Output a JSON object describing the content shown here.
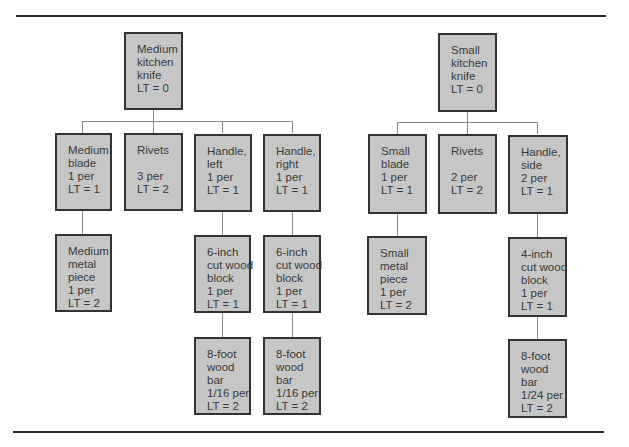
{
  "trees": [
    {
      "root": {
        "lines": [
          "Medium",
          "kitchen",
          "knife",
          "LT = 0"
        ]
      },
      "children": [
        {
          "lines": [
            "Medium",
            "blade",
            "1 per",
            "LT = 1"
          ],
          "children": [
            {
              "lines": [
                "Medium",
                "metal",
                "piece",
                "1 per",
                "LT = 2"
              ]
            }
          ]
        },
        {
          "lines": [
            "Rivets",
            "",
            "3 per",
            "LT = 2"
          ]
        },
        {
          "lines": [
            "Handle,",
            "left",
            "1 per",
            "LT = 1"
          ],
          "children": [
            {
              "lines": [
                "6-inch",
                "cut wood",
                "block",
                "1 per",
                "LT = 1"
              ],
              "children": [
                {
                  "lines": [
                    "8-foot",
                    "wood",
                    "bar",
                    "1/16 per",
                    "LT = 2"
                  ]
                }
              ]
            }
          ]
        },
        {
          "lines": [
            "Handle,",
            "right",
            "1 per",
            "LT = 1"
          ],
          "children": [
            {
              "lines": [
                "6-inch",
                "cut wood",
                "block",
                "1 per",
                "LT = 1"
              ],
              "children": [
                {
                  "lines": [
                    "8-foot",
                    "wood",
                    "bar",
                    "1/16 per",
                    "LT = 2"
                  ]
                }
              ]
            }
          ]
        }
      ]
    },
    {
      "root": {
        "lines": [
          "Small",
          "kitchen",
          "knife",
          "LT = 0"
        ]
      },
      "children": [
        {
          "lines": [
            "Small",
            "blade",
            "1 per",
            "LT = 1"
          ],
          "children": [
            {
              "lines": [
                "Small",
                "metal",
                "piece",
                "1 per",
                "LT = 2"
              ]
            }
          ]
        },
        {
          "lines": [
            "Rivets",
            "",
            "2 per",
            "LT = 2"
          ]
        },
        {
          "lines": [
            "Handle,",
            "side",
            "2 per",
            "LT = 1"
          ],
          "children": [
            {
              "lines": [
                "4-inch",
                "cut wood",
                "block",
                "1 per",
                "LT = 1"
              ],
              "children": [
                {
                  "lines": [
                    "8-foot",
                    "wood",
                    "bar",
                    "1/24 per",
                    "LT = 2"
                  ]
                }
              ]
            }
          ]
        }
      ]
    }
  ],
  "colors": {
    "box_fill": "#c6c6c6",
    "box_border": "#333333",
    "connector": "#8a8a8a",
    "rule": "#2a2a2a"
  }
}
